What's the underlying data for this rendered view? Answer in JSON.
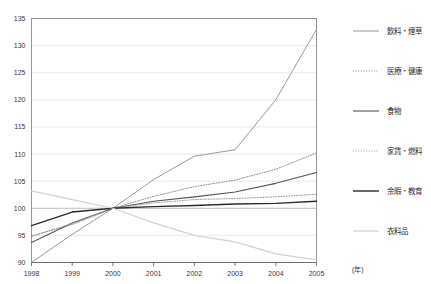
{
  "chart_data": {
    "type": "line",
    "title": "",
    "xlabel": "(年)",
    "ylabel": "",
    "xlim": [
      1998,
      2005
    ],
    "ylim": [
      90,
      135
    ],
    "grid": true,
    "legend_position": "right",
    "x": [
      1998,
      1999,
      2000,
      2001,
      2002,
      2003,
      2004,
      2005
    ],
    "xtick_labels": [
      "1998",
      "1999",
      "2000",
      "2001",
      "2002",
      "2003",
      "2004",
      "2005"
    ],
    "ytick_labels": [
      "90",
      "95",
      "100",
      "105",
      "110",
      "115",
      "120",
      "125",
      "130",
      "135"
    ],
    "ytick_values": [
      90,
      95,
      100,
      105,
      110,
      115,
      120,
      125,
      130,
      135
    ],
    "series": [
      {
        "name": "飲料・煙草",
        "values": [
          90,
          95.2,
          100,
          105.3,
          109.6,
          110.8,
          120.0,
          133.0
        ],
        "color": "#9a9a9a",
        "style": "solid",
        "width": 1.0
      },
      {
        "name": "医療・健康",
        "values": [
          94.9,
          97.0,
          100,
          102.2,
          104.0,
          105.2,
          107.2,
          110.2
        ],
        "color": "#8c8c8c",
        "style": "dotted",
        "width": 1.0
      },
      {
        "name": "食物",
        "values": [
          93.7,
          97.3,
          100,
          101.3,
          102.1,
          103.0,
          104.6,
          106.6
        ],
        "color": "#555555",
        "style": "solid",
        "width": 1.1
      },
      {
        "name": "家賃・燃料",
        "values": [
          94.8,
          97.2,
          100,
          101.0,
          101.6,
          101.8,
          102.1,
          102.6
        ],
        "color": "#a09a86",
        "style": "dotted",
        "width": 1.0
      },
      {
        "name": "余暇・教育",
        "values": [
          96.8,
          99.3,
          100,
          100.3,
          100.5,
          100.8,
          100.9,
          101.3
        ],
        "color": "#2c2c2c",
        "style": "solid",
        "width": 1.4
      },
      {
        "name": "衣料品",
        "values": [
          103.2,
          101.6,
          100,
          97.3,
          95.0,
          93.8,
          91.6,
          90.5
        ],
        "color": "#d2d2d2",
        "style": "solid",
        "width": 1.2
      }
    ]
  },
  "legend": {
    "items": [
      {
        "label": "飲料・煙草"
      },
      {
        "label": "医療・健康"
      },
      {
        "label": "食物"
      },
      {
        "label": "家賃・燃料"
      },
      {
        "label": "余暇・教育"
      },
      {
        "label": "衣料品"
      }
    ]
  },
  "axis": {
    "x_unit": "(年)"
  }
}
